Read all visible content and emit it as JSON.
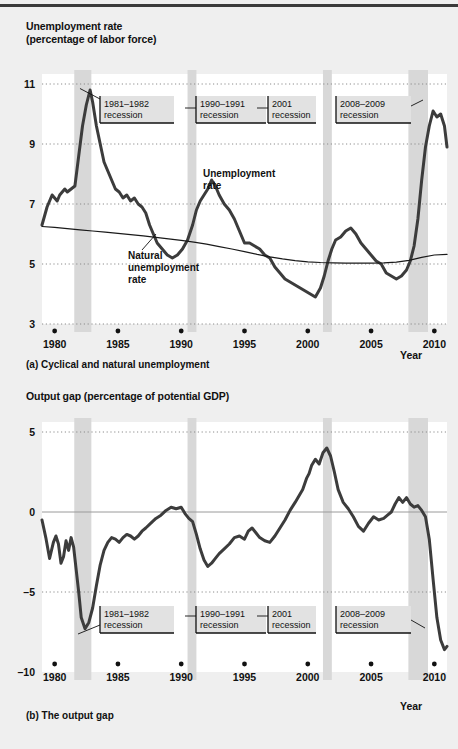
{
  "figure": {
    "panel_a_caption": "(a) Cyclical and natural unemployment",
    "panel_b_caption": "(b) The output gap",
    "x_axis_name": "Year",
    "recession_band_color": "#d8d8d8",
    "curve_color": "#3c3c3c",
    "natural_line_color": "#1a1a1a",
    "grid_color": "#8c8c8c",
    "label_box_fill": "#e2e2e2"
  },
  "annotations": [
    {
      "id": "rec8182",
      "line1": "1981–1982",
      "line2": "recession"
    },
    {
      "id": "rec9091",
      "line1": "1990–1991",
      "line2": "recession"
    },
    {
      "id": "rec2001",
      "line1": "2001",
      "line2": "recession"
    },
    {
      "id": "rec0809",
      "line1": "2008–2009",
      "line2": "recession"
    }
  ],
  "series_labels": {
    "unemployment_l1": "Unemployment",
    "unemployment_l2": "rate",
    "natural_l1": "Natural",
    "natural_l2": "unemployment",
    "natural_l3": "rate"
  },
  "chart_data": [
    {
      "type": "line",
      "id": "unemployment",
      "title": "Unemployment rate",
      "subtitle": "(percentage of labor force)",
      "ylabel": "Unemployment rate (percentage of labor force)",
      "xlabel": "Year",
      "ylim": [
        3,
        11
      ],
      "xlim": [
        1979.0,
        2011.0
      ],
      "yticks": [
        11,
        9,
        7,
        5,
        3
      ],
      "xticks": [
        1980,
        1985,
        1990,
        1995,
        2000,
        2005,
        2010
      ],
      "grid": "horizontal-dotted",
      "legend": "inline-annotations",
      "recessions": [
        {
          "label": "1981–1982 recession",
          "start": 1981.55,
          "end": 1982.9
        },
        {
          "label": "1990–1991 recession",
          "start": 1990.5,
          "end": 1991.2
        },
        {
          "label": "2001 recession",
          "start": 2001.2,
          "end": 2001.9
        },
        {
          "label": "2008–2009 recession",
          "start": 2007.95,
          "end": 2009.5
        }
      ],
      "series": [
        {
          "name": "Unemployment rate",
          "x": [
            1979.0,
            1979.4,
            1979.8,
            1980.0,
            1980.2,
            1980.4,
            1980.6,
            1980.8,
            1981.0,
            1981.3,
            1981.6,
            1981.9,
            1982.2,
            1982.5,
            1982.8,
            1983.0,
            1983.3,
            1983.6,
            1983.9,
            1984.2,
            1984.5,
            1984.8,
            1985.1,
            1985.4,
            1985.7,
            1986.0,
            1986.3,
            1986.6,
            1986.9,
            1987.2,
            1987.5,
            1987.8,
            1988.1,
            1988.5,
            1988.9,
            1989.3,
            1989.7,
            1990.1,
            1990.5,
            1990.9,
            1991.2,
            1991.5,
            1991.8,
            1992.1,
            1992.4,
            1992.7,
            1993.0,
            1993.4,
            1993.8,
            1994.2,
            1994.6,
            1995.0,
            1995.4,
            1995.8,
            1996.2,
            1996.6,
            1997.0,
            1997.4,
            1997.8,
            1998.2,
            1998.6,
            1999.0,
            1999.4,
            1999.8,
            2000.2,
            2000.6,
            2001.0,
            2001.3,
            2001.6,
            2001.9,
            2002.2,
            2002.6,
            2003.0,
            2003.4,
            2003.8,
            2004.2,
            2004.6,
            2005.0,
            2005.4,
            2005.8,
            2006.2,
            2006.6,
            2007.0,
            2007.4,
            2007.8,
            2008.1,
            2008.4,
            2008.7,
            2009.0,
            2009.3,
            2009.6,
            2009.9,
            2010.2,
            2010.5,
            2010.8,
            2011.0
          ],
          "y": [
            6.3,
            6.9,
            7.3,
            7.2,
            7.1,
            7.3,
            7.4,
            7.5,
            7.4,
            7.5,
            7.6,
            8.6,
            9.6,
            10.3,
            10.8,
            10.4,
            9.6,
            9.0,
            8.4,
            8.1,
            7.8,
            7.5,
            7.4,
            7.2,
            7.3,
            7.1,
            7.2,
            7.0,
            6.9,
            6.7,
            6.3,
            6.0,
            5.7,
            5.5,
            5.3,
            5.2,
            5.3,
            5.5,
            5.8,
            6.3,
            6.8,
            7.1,
            7.3,
            7.5,
            7.8,
            7.6,
            7.3,
            7.0,
            6.8,
            6.5,
            6.1,
            5.7,
            5.7,
            5.6,
            5.5,
            5.3,
            5.2,
            4.9,
            4.7,
            4.5,
            4.4,
            4.3,
            4.2,
            4.1,
            4.0,
            3.9,
            4.2,
            4.6,
            5.1,
            5.5,
            5.8,
            5.9,
            6.1,
            6.2,
            6.0,
            5.7,
            5.5,
            5.3,
            5.1,
            5.0,
            4.7,
            4.6,
            4.5,
            4.6,
            4.8,
            5.1,
            5.6,
            6.5,
            7.8,
            8.9,
            9.6,
            10.1,
            9.9,
            10.0,
            9.6,
            8.9
          ],
          "color": "#3c3c3c",
          "width": 3.0
        },
        {
          "name": "Natural unemployment rate",
          "x": [
            1979.0,
            1980.0,
            1981.0,
            1982.0,
            1983.0,
            1984.0,
            1985.0,
            1986.0,
            1987.0,
            1988.0,
            1989.0,
            1990.0,
            1991.0,
            1992.0,
            1993.0,
            1994.0,
            1995.0,
            1996.0,
            1997.0,
            1998.0,
            1999.0,
            2000.0,
            2001.0,
            2002.0,
            2003.0,
            2004.0,
            2005.0,
            2006.0,
            2007.0,
            2008.0,
            2009.0,
            2010.0,
            2011.0
          ],
          "y": [
            6.25,
            6.22,
            6.18,
            6.14,
            6.1,
            6.06,
            6.02,
            5.98,
            5.94,
            5.89,
            5.84,
            5.79,
            5.73,
            5.66,
            5.58,
            5.5,
            5.41,
            5.32,
            5.24,
            5.17,
            5.11,
            5.07,
            5.05,
            5.04,
            5.03,
            5.03,
            5.03,
            5.04,
            5.06,
            5.12,
            5.22,
            5.3,
            5.32
          ],
          "color": "#1a1a1a",
          "width": 1.2
        }
      ]
    },
    {
      "type": "line",
      "id": "output-gap",
      "title": "Output gap (percentage of potential GDP)",
      "ylabel": "Output gap (percentage of potential GDP)",
      "xlabel": "Year",
      "ylim": [
        -10,
        5
      ],
      "xlim": [
        1979.0,
        2011.0
      ],
      "yticks": [
        5,
        0,
        -5,
        -10
      ],
      "ytick_labels": [
        "5",
        "0",
        "–5",
        "–10"
      ],
      "xticks": [
        1980,
        1985,
        1990,
        1995,
        2000,
        2005,
        2010
      ],
      "grid": "horizontal-dotted-with-zero-line",
      "recessions": [
        {
          "label": "1981–1982 recession",
          "start": 1981.55,
          "end": 1982.9
        },
        {
          "label": "1990–1991 recession",
          "start": 1990.5,
          "end": 1991.2
        },
        {
          "label": "2001 recession",
          "start": 2001.2,
          "end": 2001.9
        },
        {
          "label": "2008–2009 recession",
          "start": 2007.95,
          "end": 2009.5
        }
      ],
      "series": [
        {
          "name": "Output gap",
          "x": [
            1979.0,
            1979.3,
            1979.6,
            1979.9,
            1980.1,
            1980.3,
            1980.5,
            1980.7,
            1980.9,
            1981.1,
            1981.3,
            1981.5,
            1981.7,
            1981.9,
            1982.1,
            1982.4,
            1982.7,
            1983.0,
            1983.3,
            1983.6,
            1983.9,
            1984.2,
            1984.5,
            1984.8,
            1985.1,
            1985.4,
            1985.7,
            1986.0,
            1986.3,
            1986.6,
            1986.9,
            1987.2,
            1987.6,
            1988.0,
            1988.4,
            1988.8,
            1989.2,
            1989.6,
            1990.0,
            1990.3,
            1990.6,
            1990.9,
            1991.2,
            1991.5,
            1991.8,
            1992.1,
            1992.4,
            1992.7,
            1993.0,
            1993.4,
            1993.8,
            1994.2,
            1994.6,
            1995.0,
            1995.3,
            1995.6,
            1995.9,
            1996.2,
            1996.6,
            1997.0,
            1997.4,
            1997.8,
            1998.2,
            1998.6,
            1999.0,
            1999.3,
            1999.6,
            1999.9,
            2000.1,
            2000.3,
            2000.6,
            2000.9,
            2001.2,
            2001.5,
            2001.8,
            2002.1,
            2002.4,
            2002.8,
            2003.2,
            2003.6,
            2004.0,
            2004.4,
            2004.8,
            2005.2,
            2005.6,
            2006.0,
            2006.3,
            2006.6,
            2006.9,
            2007.2,
            2007.5,
            2007.8,
            2008.1,
            2008.4,
            2008.7,
            2009.0,
            2009.3,
            2009.6,
            2009.9,
            2010.2,
            2010.5,
            2010.8,
            2011.0
          ],
          "y": [
            -0.5,
            -1.6,
            -2.9,
            -1.9,
            -1.5,
            -2.0,
            -3.2,
            -2.8,
            -1.8,
            -2.4,
            -1.6,
            -2.2,
            -3.6,
            -5.0,
            -6.6,
            -7.3,
            -6.9,
            -6.0,
            -4.6,
            -3.3,
            -2.4,
            -1.9,
            -1.6,
            -1.7,
            -1.9,
            -1.6,
            -1.4,
            -1.5,
            -1.7,
            -1.5,
            -1.2,
            -1.0,
            -0.7,
            -0.4,
            -0.2,
            0.1,
            0.3,
            0.2,
            0.3,
            -0.1,
            -0.4,
            -0.6,
            -1.4,
            -2.3,
            -3.0,
            -3.4,
            -3.2,
            -2.9,
            -2.6,
            -2.3,
            -2.0,
            -1.6,
            -1.5,
            -1.7,
            -1.2,
            -1.0,
            -1.3,
            -1.6,
            -1.8,
            -1.9,
            -1.5,
            -1.0,
            -0.5,
            0.1,
            0.6,
            1.0,
            1.4,
            2.1,
            2.4,
            2.9,
            3.3,
            3.0,
            3.7,
            4.0,
            3.5,
            2.5,
            1.4,
            0.6,
            0.2,
            -0.3,
            -0.9,
            -1.2,
            -0.7,
            -0.3,
            -0.5,
            -0.4,
            -0.2,
            0.0,
            0.5,
            0.9,
            0.6,
            0.9,
            0.5,
            0.3,
            0.4,
            0.1,
            -0.3,
            -1.7,
            -4.2,
            -6.6,
            -8.0,
            -8.6,
            -8.4,
            -7.6,
            -6.8,
            -6.3,
            -6.6
          ],
          "color": "#3c3c3c",
          "width": 3.0
        }
      ]
    }
  ]
}
